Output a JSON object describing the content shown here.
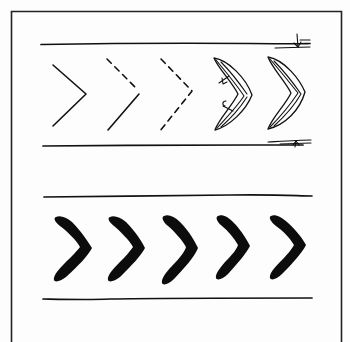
{
  "figure": {
    "description": "Hand-drawn sketch of chevron pattern variations between parallel lane lines",
    "colors": {
      "ink": "#111111",
      "paper": "#fdfdfd"
    },
    "top_panel": {
      "label": "Chevron outline variations",
      "chevrons": [
        {
          "style": "solid-outline"
        },
        {
          "style": "half-dashed"
        },
        {
          "style": "dashed"
        },
        {
          "style": "double-line-with-arrows"
        },
        {
          "style": "double-line"
        }
      ],
      "dimension_marks": [
        "top-right-width-tick",
        "bottom-right-width-tick"
      ]
    },
    "bottom_panel": {
      "label": "Filled chevron row",
      "chevron_count": 5,
      "chevrons": [
        {
          "style": "filled"
        },
        {
          "style": "filled"
        },
        {
          "style": "filled"
        },
        {
          "style": "filled"
        },
        {
          "style": "filled"
        }
      ]
    }
  }
}
